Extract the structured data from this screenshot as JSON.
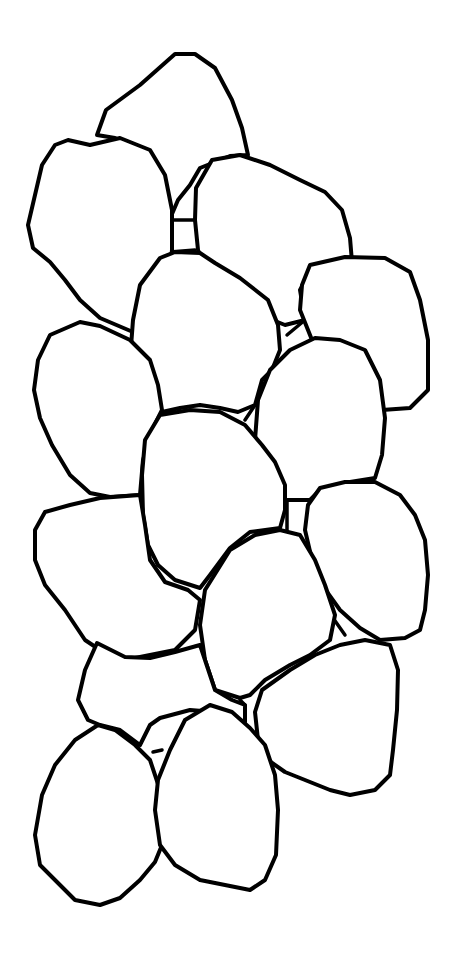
{
  "image": {
    "subject": "stacked stones coloring page",
    "background_color": "#ffffff",
    "line_color": "#000000",
    "stone_count": 17
  },
  "stones": [
    {
      "id": "stone-top",
      "d": "M97 135 L106 110 L140 85 L175 54 L195 54 L215 68 L232 100 L242 128 L248 155 L230 156 L200 168 L190 185 L178 200 L172 214 L160 180 L140 150 L115 138 Z"
    },
    {
      "id": "stone-upper-left",
      "d": "M68 140 L90 145 L120 138 L150 150 L165 175 L172 210 L172 250 L168 285 L165 330 L140 335 L100 318 L80 300 L65 280 L50 262 L33 248 L28 225 L35 195 L42 165 L55 145 Z"
    },
    {
      "id": "stone-upper-middle-right",
      "d": "M212 160 L240 155 L270 165 L300 180 L325 192 L342 210 L350 238 L352 262 L340 270 L310 272 L300 290 L305 320 L285 325 L260 315 L230 300 L210 278 L198 250 L195 220 L196 188 Z"
    },
    {
      "id": "stone-right-top",
      "d": "M310 265 L345 257 L385 258 L410 272 L420 300 L428 340 L428 390 L410 408 L382 410 L355 395 L330 365 L312 340 L300 310 L302 285 Z"
    },
    {
      "id": "stone-center-upper",
      "d": "M160 258 L175 252 L200 253 L215 263 L240 278 L268 300 L278 325 L280 350 L272 370 L262 380 L255 405 L238 412 L220 408 L200 405 L180 408 L162 412 L150 418 L140 390 L130 360 L133 320 L140 285 Z"
    },
    {
      "id": "stone-left-middle",
      "d": "M80 322 L100 326 L130 340 L150 360 L158 385 L162 410 L152 430 L143 460 L140 495 L110 497 L90 493 L70 475 L52 445 L40 418 L34 390 L38 360 L50 335 Z"
    },
    {
      "id": "stone-right-middle",
      "d": "M290 350 L315 338 L340 340 L365 350 L380 380 L385 418 L382 455 L375 478 L350 482 L320 490 L310 500 L285 500 L268 490 L258 470 L255 440 L258 400 L270 370 Z"
    },
    {
      "id": "stone-center",
      "d": "M160 415 L190 410 L220 412 L245 425 L262 445 L275 462 L285 485 L285 510 L280 528 L250 532 L230 548 L210 575 L200 588 L175 580 L158 565 L148 545 L143 515 L142 475 L145 440 Z"
    },
    {
      "id": "stone-right-lower",
      "d": "M320 488 L345 482 L375 482 L400 495 L415 515 L425 540 L428 575 L425 610 L420 630 L405 638 L380 640 L360 628 L340 610 L322 585 L312 560 L305 530 L308 505 Z"
    },
    {
      "id": "stone-left-lower",
      "d": "M45 512 L70 505 L100 498 L140 495 L145 525 L150 560 L165 582 L188 590 L200 600 L195 630 L175 650 L150 655 L125 660 L100 650 L85 640 L65 610 L45 585 L35 560 L35 530 Z"
    },
    {
      "id": "stone-center-lower",
      "d": "M205 590 L230 550 L255 535 L280 530 L300 535 L315 560 L325 585 L335 615 L330 640 L310 655 L290 665 L265 680 L250 695 L240 698 L215 690 L205 660 L200 625 Z"
    },
    {
      "id": "stone-bottom-left-wedge",
      "d": "M97 643 L125 657 L150 658 L175 652 L200 645 L205 660 L215 690 L232 700 L245 705 L245 722 L215 712 L190 710 L160 718 L150 725 L140 745 L120 730 L100 725 L88 720 L78 700 L85 670 Z"
    },
    {
      "id": "stone-right-bottom",
      "d": "M262 690 L290 670 L315 655 L340 645 L365 640 L390 645 L398 670 L397 710 L393 750 L390 775 L375 790 L350 795 L330 790 L305 780 L285 772 L268 760 L258 740 L255 712 Z"
    },
    {
      "id": "stone-bottom-left",
      "d": "M75 740 L98 725 L115 730 L135 745 L150 760 L160 790 L162 845 L155 862 L140 880 L120 898 L100 905 L75 900 L55 880 L40 865 L35 835 L42 795 L55 765 Z"
    },
    {
      "id": "stone-bottom-center",
      "d": "M185 720 L210 705 L232 712 L250 728 L265 745 L275 775 L278 810 L276 855 L265 880 L250 890 L230 886 L200 880 L175 865 L160 845 L155 810 L158 780 L170 750 Z"
    }
  ],
  "gap_lines": [
    {
      "id": "gap-1",
      "d": "M172 220 L195 220"
    },
    {
      "id": "gap-2",
      "d": "M170 252 L195 250"
    },
    {
      "id": "gap-3",
      "d": "M287 335 L305 320"
    },
    {
      "id": "gap-4",
      "d": "M245 420 L255 405"
    },
    {
      "id": "gap-5",
      "d": "M287 495 L287 530"
    },
    {
      "id": "gap-6",
      "d": "M240 700 L245 705"
    },
    {
      "id": "gap-7",
      "d": "M153 752 L162 750"
    },
    {
      "id": "gap-8",
      "d": "M333 618 L345 635"
    }
  ]
}
